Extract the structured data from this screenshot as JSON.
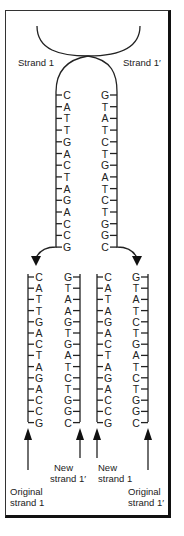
{
  "labels": {
    "strand1": "Strand 1",
    "strand1_prime": "Strand 1′",
    "new_strand1_prime_line1": "New",
    "new_strand1_prime_line2": "strand 1′",
    "new_strand1_line1": "New",
    "new_strand1_line2": "strand 1",
    "original_strand1_line1": "Original",
    "original_strand1_line2": "strand 1",
    "original_strand1_prime_line1": "Original",
    "original_strand1_prime_line2": "strand 1′"
  },
  "parent": {
    "strand1": [
      "C",
      "A",
      "T",
      "T",
      "G",
      "A",
      "C",
      "T",
      "A",
      "G",
      "A",
      "C",
      "C",
      "G"
    ],
    "strand1_prime": [
      "G",
      "T",
      "A",
      "T",
      "C",
      "T",
      "G",
      "A",
      "T",
      "C",
      "T",
      "G",
      "G",
      "C"
    ]
  },
  "daughter_left": {
    "original_strand1": [
      "C",
      "A",
      "T",
      "T",
      "G",
      "A",
      "C",
      "T",
      "A",
      "G",
      "A",
      "C",
      "C",
      "G"
    ],
    "new_strand1_prime": [
      "G",
      "T",
      "A",
      "A",
      "G",
      "T",
      "G",
      "A",
      "T",
      "C",
      "T",
      "G",
      "G",
      "C"
    ]
  },
  "daughter_right": {
    "new_strand1": [
      "C",
      "A",
      "T",
      "A",
      "G",
      "A",
      "C",
      "T",
      "A",
      "G",
      "A",
      "C",
      "C",
      "G"
    ],
    "original_strand1_prime": [
      "G",
      "T",
      "A",
      "T",
      "C",
      "T",
      "G",
      "A",
      "T",
      "C",
      "T",
      "G",
      "G",
      "C"
    ]
  }
}
